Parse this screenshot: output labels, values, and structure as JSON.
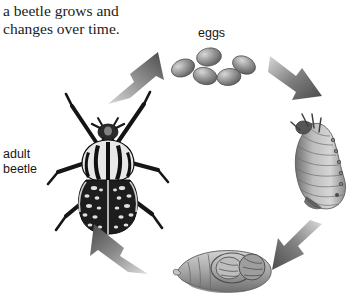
{
  "figure": {
    "title": "a beetle grows and\nchanges over time.",
    "background_color": "#ffffff",
    "text_color": "#201d1c",
    "diagram_type": "life-cycle-circular",
    "rotation": "clockwise"
  },
  "labels": {
    "eggs": "eggs",
    "adult_beetle": "adult\nbeetle"
  },
  "stages": [
    {
      "id": "eggs",
      "label": "eggs",
      "position": "top",
      "count": 5,
      "description": "cluster of five grey oval eggs",
      "color": "#8a8a8a"
    },
    {
      "id": "larva",
      "label": "",
      "position": "right",
      "description": "C-shaped segmented grub with legs and head at top",
      "color": "#9a9a9a"
    },
    {
      "id": "pupa",
      "label": "",
      "position": "bottom",
      "description": "horizontal pupa with developing wing cases and legs",
      "color": "#8f8f8f"
    },
    {
      "id": "adult-beetle",
      "label": "adult\nbeetle",
      "position": "left",
      "description": "goliath beetle seen from above with striped pronotum and mottled elytra",
      "color": "#2b2b2b"
    }
  ],
  "arrows": [
    {
      "id": "adult-to-eggs",
      "from": "adult-beetle",
      "to": "eggs",
      "direction": "up-right",
      "color": "#6e6e6e"
    },
    {
      "id": "eggs-to-larva",
      "from": "eggs",
      "to": "larva",
      "direction": "down-right",
      "color": "#6e6e6e"
    },
    {
      "id": "larva-to-pupa",
      "from": "larva",
      "to": "pupa",
      "direction": "down-left",
      "color": "#6e6e6e"
    },
    {
      "id": "pupa-to-adult",
      "from": "pupa",
      "to": "adult-beetle",
      "direction": "up-left",
      "color": "#6e6e6e"
    }
  ]
}
